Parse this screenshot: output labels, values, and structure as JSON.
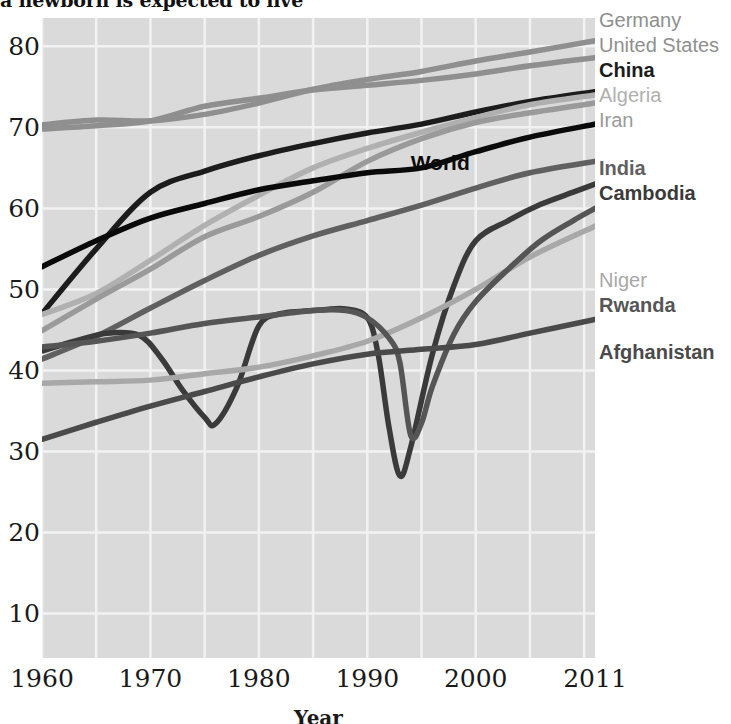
{
  "title": "a newborn is expected to live",
  "axes": {
    "xlabel": "Year",
    "ylabel": "",
    "yticks": [
      "10",
      "20",
      "30",
      "40",
      "50",
      "60",
      "70",
      "80"
    ],
    "xticks": [
      "1960",
      "1970",
      "1980",
      "1990",
      "2000",
      "2011"
    ]
  },
  "inline_labels": [
    {
      "text": "World",
      "x": 1994.0,
      "y": 65.6,
      "color": "#0a0a0a"
    }
  ],
  "legend": [
    {
      "label": "Germany",
      "color": "#8f8f8f",
      "y": 20
    },
    {
      "label": "United States",
      "color": "#8f8f8f",
      "y": 45
    },
    {
      "label": "China",
      "color": "#1c1c1c",
      "y": 70
    },
    {
      "label": "Algeria",
      "color": "#b0b0b0",
      "y": 95
    },
    {
      "label": "Iran",
      "color": "#9a9a9a",
      "y": 120
    },
    {
      "label": "India",
      "color": "#606060",
      "y": 168
    },
    {
      "label": "Cambodia",
      "color": "#3a3a3a",
      "y": 193
    },
    {
      "label": "Niger",
      "color": "#a8a8a8",
      "y": 280
    },
    {
      "label": "Rwanda",
      "color": "#555555",
      "y": 305
    },
    {
      "label": "Afghanistan",
      "color": "#4a4a4a",
      "y": 352
    }
  ],
  "chart_data": {
    "type": "line",
    "title": "a newborn is expected to live",
    "xlabel": "Year",
    "ylabel": "",
    "xlim": [
      1960,
      2011
    ],
    "ylim": [
      4.5,
      83.5
    ],
    "grid": true,
    "grid_color": "#f2f2f2",
    "plot_background": "#dadada",
    "legend_position": "right-outside",
    "x": [
      1960,
      1965,
      1970,
      1975,
      1980,
      1985,
      1990,
      1995,
      2000,
      2005,
      2011
    ],
    "series": [
      {
        "name": "Germany",
        "color": "#8f8f8f",
        "values": [
          70.3,
          70.9,
          70.8,
          71.6,
          73.0,
          74.7,
          75.9,
          76.9,
          78.2,
          79.3,
          80.7
        ]
      },
      {
        "name": "United States",
        "color": "#8f8f8f",
        "values": [
          69.8,
          70.2,
          70.8,
          72.6,
          73.6,
          74.6,
          75.2,
          75.8,
          76.6,
          77.6,
          78.6
        ]
      },
      {
        "name": "China",
        "color": "#1c1c1c",
        "values": [
          47.0,
          55.0,
          62.0,
          64.6,
          66.5,
          68.0,
          69.3,
          70.4,
          71.9,
          73.2,
          74.4
        ]
      },
      {
        "name": "Algeria",
        "color": "#b0b0b0",
        "values": [
          46.9,
          49.5,
          53.6,
          57.9,
          61.6,
          65.0,
          67.4,
          69.4,
          71.2,
          72.8,
          74.0
        ]
      },
      {
        "name": "Iran",
        "color": "#9a9a9a",
        "values": [
          44.9,
          48.8,
          52.5,
          56.5,
          59.0,
          62.0,
          65.8,
          68.6,
          70.6,
          71.8,
          73.0
        ]
      },
      {
        "name": "India",
        "color": "#606060",
        "values": [
          41.4,
          44.2,
          47.7,
          51.1,
          54.2,
          56.6,
          58.5,
          60.4,
          62.5,
          64.4,
          65.8
        ]
      },
      {
        "name": "Cambodia",
        "color": "#3a3a3a",
        "values": [
          42.4,
          44.8,
          41.0,
          33.6,
          46.0,
          48.0,
          47.6,
          27.0,
          56.0,
          59.6,
          63.0
        ]
      },
      {
        "name": "Niger",
        "color": "#a8a8a8",
        "values": [
          38.4,
          38.6,
          38.8,
          39.6,
          40.4,
          41.8,
          43.6,
          46.5,
          50.0,
          54.0,
          57.8
        ]
      },
      {
        "name": "Rwanda",
        "color": "#555555",
        "values": [
          42.9,
          43.6,
          44.6,
          45.6,
          46.6,
          47.2,
          40.0,
          32.0,
          48.5,
          55.0,
          60.0
        ]
      },
      {
        "name": "Afghanistan",
        "color": "#4a4a4a",
        "values": [
          31.5,
          33.6,
          35.6,
          37.4,
          39.2,
          40.8,
          42.0,
          42.6,
          43.2,
          44.6,
          46.3
        ]
      },
      {
        "name": "World",
        "color": "#0a0a0a",
        "values": [
          52.8,
          56.0,
          58.8,
          60.6,
          62.3,
          63.4,
          64.4,
          65.0,
          67.0,
          68.8,
          70.4
        ]
      }
    ],
    "series_detail": {
      "Cambodia": {
        "x": [
          1960,
          1963,
          1966,
          1969,
          1971,
          1973,
          1975,
          1976,
          1978,
          1980,
          1982,
          1984,
          1986,
          1988,
          1990,
          1991,
          1992,
          1993,
          1994,
          1996,
          1998,
          2000,
          2003,
          2006,
          2009,
          2011
        ],
        "values": [
          42.4,
          43.6,
          44.6,
          44.3,
          41.5,
          37.5,
          34.2,
          33.4,
          38.0,
          45.5,
          47.0,
          47.3,
          47.5,
          47.6,
          46.5,
          42.0,
          33.0,
          27.0,
          30.5,
          42.0,
          50.5,
          56.0,
          58.5,
          60.5,
          62.0,
          63.0
        ]
      },
      "Rwanda": {
        "x": [
          1960,
          1965,
          1970,
          1975,
          1980,
          1985,
          1988,
          1990,
          1992,
          1993,
          1994,
          1995,
          1996,
          1998,
          2000,
          2003,
          2006,
          2009,
          2011
        ],
        "values": [
          42.9,
          43.6,
          44.6,
          45.8,
          46.6,
          47.4,
          47.4,
          46.5,
          44.0,
          41.0,
          32.0,
          33.5,
          38.0,
          44.5,
          48.5,
          52.5,
          56.0,
          58.5,
          60.0
        ]
      }
    }
  }
}
